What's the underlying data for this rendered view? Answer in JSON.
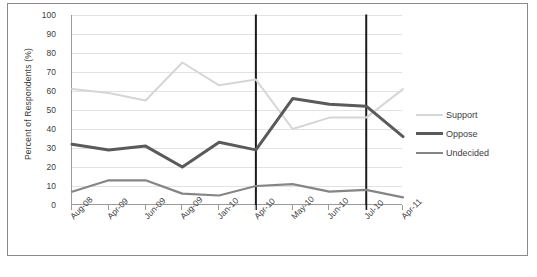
{
  "chart_data": {
    "type": "line",
    "title": "",
    "xlabel": "",
    "ylabel": "Percent of Respondents (%)",
    "ylim": [
      0,
      100
    ],
    "ytick_step": 10,
    "yticks": [
      100,
      90,
      80,
      70,
      60,
      50,
      40,
      30,
      20,
      10,
      0
    ],
    "grid": true,
    "legend_position": "right",
    "categories": [
      "Aug-08",
      "Apr-09",
      "Jun-09",
      "Aug-09",
      "Jan-10",
      "Apr-10",
      "May-10",
      "Jun-10",
      "Jul-10",
      "Apr-11"
    ],
    "series": [
      {
        "name": "Support",
        "color": "#d6d6d6",
        "width": 2,
        "values": [
          61,
          59,
          55,
          75,
          63,
          66,
          40,
          46,
          46,
          61
        ]
      },
      {
        "name": "Oppose",
        "color": "#5a5a5a",
        "width": 3,
        "values": [
          32,
          29,
          31,
          20,
          33,
          29,
          56,
          53,
          52,
          36
        ]
      },
      {
        "name": "Undecided",
        "color": "#858585",
        "width": 2.2,
        "values": [
          7,
          13,
          13,
          6,
          5,
          10,
          11,
          7,
          8,
          4
        ]
      }
    ],
    "reference_lines": [
      {
        "at_category": "Apr-10",
        "color": "#1a1a1a",
        "width": 2
      },
      {
        "at_category": "Jul-10",
        "color": "#1a1a1a",
        "width": 2
      }
    ],
    "annotations": []
  },
  "figure": {
    "border_color": "#8a8a8a",
    "background": "#ffffff",
    "caption": ""
  }
}
